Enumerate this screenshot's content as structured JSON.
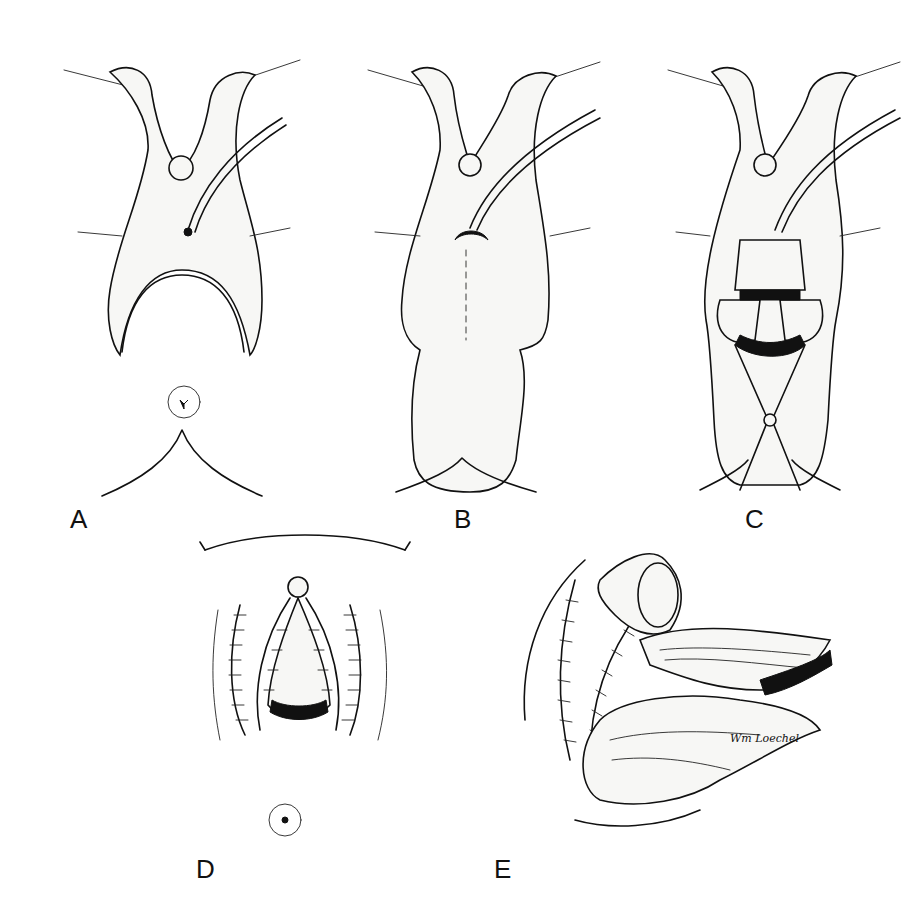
{
  "figure": {
    "type": "surgical illustration",
    "panels": [
      {
        "id": "A",
        "label": "A",
        "description": "Inverted-U incision with labial flaps retracted, urethral meatus and catheter"
      },
      {
        "id": "B",
        "label": "B",
        "description": "Flap elevated with dashed midline incision line and catheter"
      },
      {
        "id": "C",
        "label": "C",
        "description": "Tissue opened and held with retractor clamp"
      },
      {
        "id": "D",
        "label": "D",
        "description": "Closure with interrupted sutures"
      },
      {
        "id": "E",
        "label": "E",
        "description": "Sagittal cross-section view with suture lines"
      }
    ],
    "signature": "Wm Loechel"
  }
}
